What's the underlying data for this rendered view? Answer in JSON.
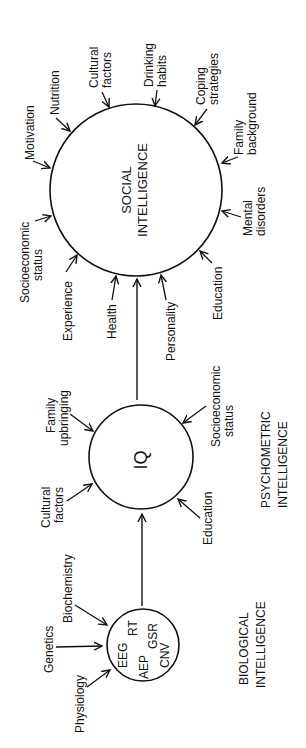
{
  "diagram": {
    "social": {
      "line1": "SOCIAL",
      "line2": "INTELLIGENCE",
      "factors": {
        "motivation": "Motivation",
        "nutrition": "Nutrition",
        "cultural_1": "Cultural",
        "cultural_2": "factors",
        "drinking_1": "Drinking",
        "drinking_2": "habits",
        "coping_1": "Coping",
        "coping_2": "strategies",
        "family_1": "Family",
        "family_2": "background",
        "mental_1": "Mental",
        "mental_2": "disorders",
        "education": "Education",
        "personality": "Personality",
        "health": "Health",
        "experience": "Experience",
        "socio_1": "Socioeconomic",
        "socio_2": "status"
      }
    },
    "iq": {
      "label": "IQ",
      "factors": {
        "family_1": "Family",
        "family_2": "upbringing",
        "cultural_1": "Cultural",
        "cultural_2": "factors",
        "socio_1": "Socioeconomic",
        "socio_2": "status",
        "education": "Education"
      }
    },
    "biological": {
      "measures": {
        "eeg": "EEG",
        "rt": "RT",
        "aep": "AEP",
        "gsr": "GSR",
        "cnv": "CNV"
      },
      "factors": {
        "biochemistry": "Biochemistry",
        "genetics": "Genetics",
        "physiology": "Physiology"
      }
    },
    "captions": {
      "psychometric_1": "PSYCHOMETRIC",
      "psychometric_2": "INTELLIGENCE",
      "biological_1": "BIOLOGICAL",
      "biological_2": "INTELLIGENCE"
    }
  }
}
